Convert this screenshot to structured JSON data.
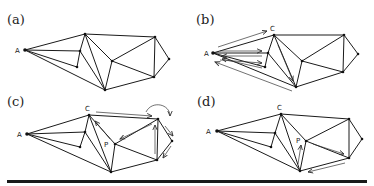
{
  "panels": [
    {
      "id": "a",
      "label": "(a)",
      "label_pos": [
        7,
        12
      ],
      "vertices": {
        "A": [
          25,
          50
        ],
        "C": [
          85,
          34
        ],
        "I1": [
          80,
          51
        ],
        "I2": [
          77,
          67
        ],
        "P": [
          112,
          61
        ],
        "TR": [
          155,
          37
        ],
        "R": [
          169,
          59
        ],
        "BR": [
          154,
          77
        ],
        "B": [
          105,
          90
        ]
      },
      "vertex_labels": [
        {
          "text": "A",
          "at": [
            15,
            53
          ]
        }
      ],
      "arrows": []
    },
    {
      "id": "b",
      "label": "(b)",
      "label_pos": [
        196,
        12
      ],
      "vertices": {
        "A": [
          213,
          53
        ],
        "C": [
          274,
          35
        ],
        "I1": [
          268,
          53
        ],
        "I2": [
          265,
          67
        ],
        "P": [
          302,
          61
        ],
        "TR": [
          344,
          35
        ],
        "R": [
          358,
          54
        ],
        "BR": [
          343,
          72
        ],
        "B": [
          296,
          87
        ]
      },
      "vertex_labels": [
        {
          "text": "A",
          "at": [
            204,
            56
          ]
        },
        {
          "text": "C",
          "at": [
            270,
            31
          ]
        }
      ],
      "arrows": [
        [
          [
            218,
            47
          ],
          [
            267,
            31
          ]
        ],
        [
          [
            220,
            51
          ],
          [
            262,
            51
          ]
        ],
        [
          [
            262,
            56
          ],
          [
            222,
            56
          ]
        ],
        [
          [
            220,
            60
          ],
          [
            262,
            63
          ]
        ],
        [
          [
            262,
            68
          ],
          [
            222,
            59
          ]
        ],
        [
          [
            278,
            45
          ],
          [
            293,
            81
          ]
        ],
        [
          [
            292,
            91
          ],
          [
            215,
            62
          ]
        ]
      ]
    },
    {
      "id": "c",
      "label": "(c)",
      "label_pos": [
        7,
        94
      ],
      "vertices": {
        "A": [
          27,
          134
        ],
        "C": [
          89,
          115
        ],
        "I1": [
          85,
          132
        ],
        "I2": [
          80,
          147
        ],
        "P": [
          115,
          144
        ],
        "TR": [
          158,
          119
        ],
        "R": [
          172,
          141
        ],
        "BR": [
          157,
          160
        ],
        "B": [
          111,
          172
        ]
      },
      "vertex_labels": [
        {
          "text": "A",
          "at": [
            17,
            137
          ]
        },
        {
          "text": "C",
          "at": [
            85,
            111
          ]
        },
        {
          "text": "P",
          "at": [
            104,
            147
          ]
        }
      ],
      "arrows": [
        [
          [
            96,
            112
          ],
          [
            152,
            116
          ]
        ],
        [
          [
            110,
            139
          ],
          [
            95,
            121
          ]
        ],
        [
          [
            152,
            124
          ],
          [
            120,
            139
          ]
        ],
        [
          [
            155,
            154
          ],
          [
            155,
            125
          ]
        ],
        [
          [
            165,
            126
          ],
          [
            173,
            136
          ]
        ],
        [
          [
            171,
            146
          ],
          [
            163,
            158
          ]
        ]
      ],
      "curve_arrow": "M146,112 C152,100 170,104 170,116"
    },
    {
      "id": "d",
      "label": "(d)",
      "label_pos": [
        197,
        94
      ],
      "vertices": {
        "A": [
          217,
          131
        ],
        "C": [
          281,
          114
        ],
        "I1": [
          275,
          133
        ],
        "I2": [
          271,
          147
        ],
        "P": [
          306,
          141
        ],
        "TR": [
          349,
          119
        ],
        "R": [
          362,
          139
        ],
        "BR": [
          349,
          158
        ],
        "B": [
          300,
          171
        ]
      },
      "vertex_labels": [
        {
          "text": "A",
          "at": [
            206,
            134
          ]
        },
        {
          "text": "C",
          "at": [
            277,
            110
          ]
        },
        {
          "text": "P",
          "at": [
            296,
            143
          ]
        }
      ],
      "arrows": [
        [
          [
            298,
            164
          ],
          [
            301,
            145
          ]
        ],
        [
          [
            313,
            144
          ],
          [
            344,
            154
          ]
        ],
        [
          [
            345,
            163
          ],
          [
            308,
            172
          ]
        ]
      ]
    }
  ],
  "edges": [
    [
      "A",
      "C"
    ],
    [
      "A",
      "I1"
    ],
    [
      "I1",
      "I2"
    ],
    [
      "A",
      "I2"
    ],
    [
      "A",
      "B"
    ],
    [
      "C",
      "I1"
    ],
    [
      "I1",
      "B"
    ],
    [
      "C",
      "B"
    ],
    [
      "C",
      "P"
    ],
    [
      "P",
      "B"
    ],
    [
      "C",
      "TR"
    ],
    [
      "P",
      "TR"
    ],
    [
      "P",
      "BR"
    ],
    [
      "TR",
      "BR"
    ],
    [
      "TR",
      "R"
    ],
    [
      "R",
      "BR"
    ],
    [
      "B",
      "BR"
    ]
  ],
  "colors": {
    "edge": "#1a1a1a",
    "arrow": "#333333",
    "vertex": "#111111",
    "bar": "#1a1a1a"
  }
}
